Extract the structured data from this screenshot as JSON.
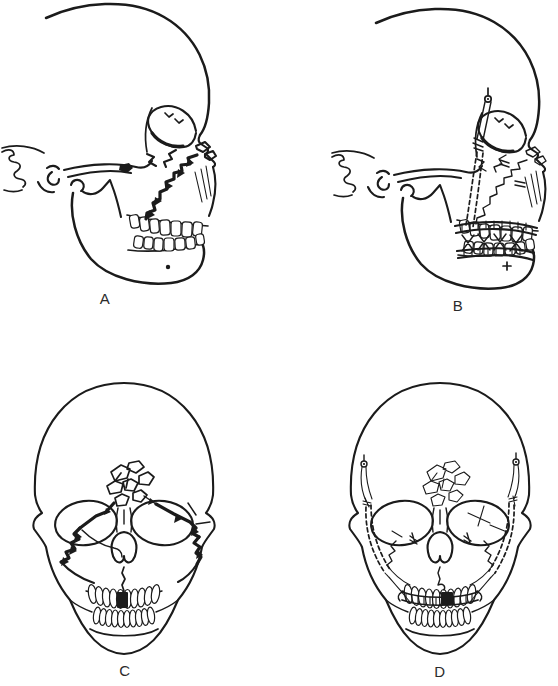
{
  "page": {
    "background_color": "#ffffff",
    "ink_color": "#1b1b1b"
  },
  "figure": {
    "panels": [
      {
        "label": "A"
      },
      {
        "label": "B"
      },
      {
        "label": "C"
      },
      {
        "label": "D"
      }
    ]
  }
}
